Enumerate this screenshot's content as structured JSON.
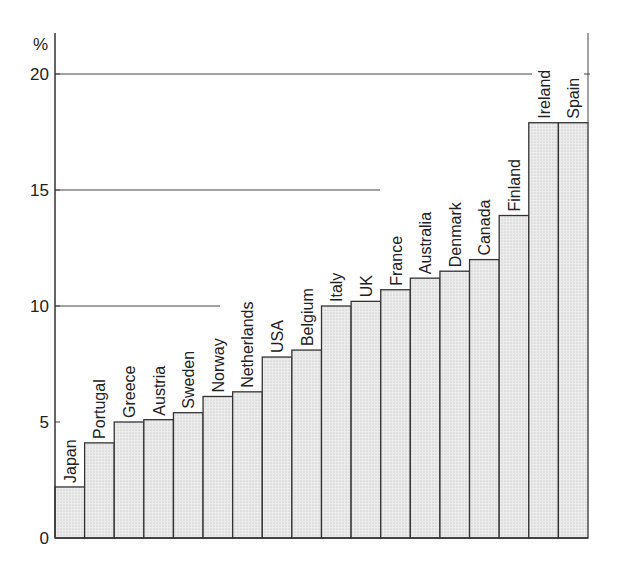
{
  "chart_data": {
    "type": "bar",
    "title": "",
    "xlabel": "",
    "ylabel": "%",
    "ylim": [
      0,
      20
    ],
    "yticks": [
      0,
      5,
      10,
      15,
      20
    ],
    "grid": "horizontal lines at 10, 15, 20 (partial)",
    "legend": null,
    "categories": [
      "Japan",
      "Portugal",
      "Greece",
      "Austria",
      "Sweden",
      "Norway",
      "Netherlands",
      "USA",
      "Belgium",
      "Italy",
      "UK",
      "France",
      "Australia",
      "Denmark",
      "Canada",
      "Finland",
      "Ireland",
      "Spain"
    ],
    "values": [
      2.2,
      4.1,
      5.0,
      5.1,
      5.4,
      6.1,
      6.3,
      7.8,
      8.1,
      10.0,
      10.2,
      10.7,
      11.2,
      11.5,
      12.0,
      13.9,
      17.9,
      17.9
    ],
    "colors": {
      "bar_fill": "#e4e4e4",
      "bar_stroke": "#333333",
      "grid": "#444444"
    }
  },
  "axis": {
    "unit_label": "%",
    "ticks": [
      "0",
      "5",
      "10",
      "15",
      "20"
    ]
  }
}
